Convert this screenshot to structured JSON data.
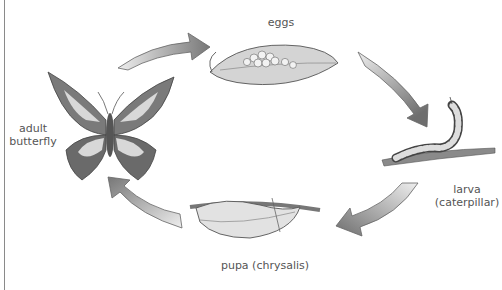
{
  "diagram": {
    "stages": [
      {
        "id": "eggs",
        "label": "eggs"
      },
      {
        "id": "larva",
        "label_line1": "larva",
        "label_line2": "(caterpillar)"
      },
      {
        "id": "pupa",
        "label": "pupa (chrysalis)"
      },
      {
        "id": "adult",
        "label_line1": "adult",
        "label_line2": "butterfly"
      }
    ],
    "arrows": [
      "adult-to-eggs",
      "eggs-to-larva",
      "larva-to-pupa",
      "pupa-to-adult"
    ],
    "colors": {
      "arrow_dark": "#6e6e6e",
      "arrow_light": "#e6e6e6",
      "ink": "#444444",
      "wing_light": "#d8d8d8",
      "wing_dark": "#6a6a6a"
    }
  }
}
